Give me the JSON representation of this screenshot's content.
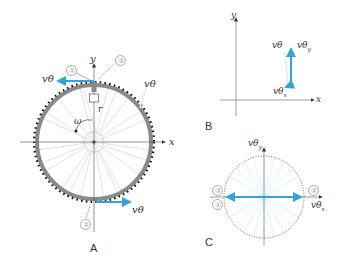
{
  "panels": {
    "A": {
      "label": "A",
      "axis_x": "x",
      "axis_y": "y",
      "radius_label": "r",
      "omega_label": "ω",
      "v_top_left": "vθ",
      "v_top_right": "vθ",
      "v_bottom": "vθ",
      "markers": [
        "①",
        "③",
        "②"
      ]
    },
    "B": {
      "label": "B",
      "axis_x": "x",
      "axis_y": "y",
      "v_label": "vθ",
      "vy_label": "vθ",
      "vy_sub": "y",
      "vx_label": "vθ",
      "vx_sub": "x"
    },
    "C": {
      "label": "C",
      "vy_label": "vθ",
      "vy_sub": "y",
      "vx_label": "vθ",
      "vx_sub": "x",
      "markers": [
        "③",
        "①",
        "②"
      ]
    }
  },
  "colors": {
    "vector": "#3aa0d8",
    "rim": "#8a8a8a",
    "dots": "#111111",
    "axis": "#666666",
    "spokes": "#cfcfcf",
    "light_spokes": "#cdeaf5"
  }
}
